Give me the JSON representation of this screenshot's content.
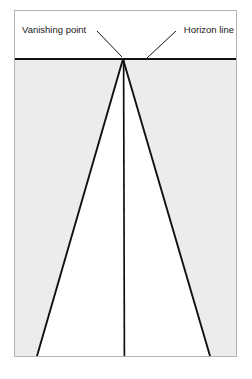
{
  "figure": {
    "type": "perspective-diagram",
    "canvas": {
      "width": 252,
      "height": 379,
      "background": "#ffffff"
    },
    "frame": {
      "name": "picture-frame",
      "x": 14.5,
      "y": 10.5,
      "width": 222,
      "height": 346,
      "stroke": "#b3b3b3",
      "stroke_width": 1,
      "fill": "#ffffff"
    },
    "sky_region": {
      "name": "sky-region",
      "fill": "#ffffff",
      "x": 15,
      "y": 11,
      "width": 221,
      "height": 48
    },
    "ground_region": {
      "name": "ground-region",
      "fill": "#ececec",
      "x": 15,
      "y": 59,
      "width": 221,
      "height": 297
    },
    "road_region": {
      "name": "road-region",
      "fill": "#ffffff",
      "points": "123,59 37,356 210,356"
    },
    "horizon": {
      "name": "horizon-line",
      "x1": 15,
      "y1": 59,
      "x2": 236,
      "y2": 59,
      "stroke": "#111111",
      "stroke_width": 2
    },
    "vanishing_point": {
      "name": "vanishing-point",
      "x": 123,
      "y": 59
    },
    "perspective_lines": [
      {
        "name": "left-receding-line",
        "x1": 123,
        "y1": 59,
        "x2": 37,
        "y2": 356,
        "stroke": "#111111",
        "stroke_width": 1.9
      },
      {
        "name": "right-receding-line",
        "x1": 123,
        "y1": 59,
        "x2": 210,
        "y2": 356,
        "stroke": "#111111",
        "stroke_width": 1.9
      },
      {
        "name": "center-receding-line",
        "x1": 123.5,
        "y1": 59,
        "x2": 124.5,
        "y2": 356,
        "stroke": "#111111",
        "stroke_width": 1.7
      }
    ],
    "labels": [
      {
        "id": "vanishing-point-label",
        "text": "Vanishing point",
        "text_x": 22,
        "text_y": 33,
        "anchor": "start",
        "leader": {
          "x1": 97,
          "y1": 31,
          "x2": 122,
          "y2": 57,
          "stroke": "#111111",
          "stroke_width": 1
        }
      },
      {
        "id": "horizon-line-label",
        "text": "Horizon line",
        "text_x": 234,
        "text_y": 33,
        "anchor": "end",
        "leader": {
          "x1": 176,
          "y1": 31,
          "x2": 147,
          "y2": 58,
          "stroke": "#111111",
          "stroke_width": 1
        }
      }
    ],
    "colors": {
      "ink": "#111111",
      "ground_gray": "#ececec",
      "frame_gray": "#b3b3b3",
      "paper": "#ffffff"
    }
  }
}
